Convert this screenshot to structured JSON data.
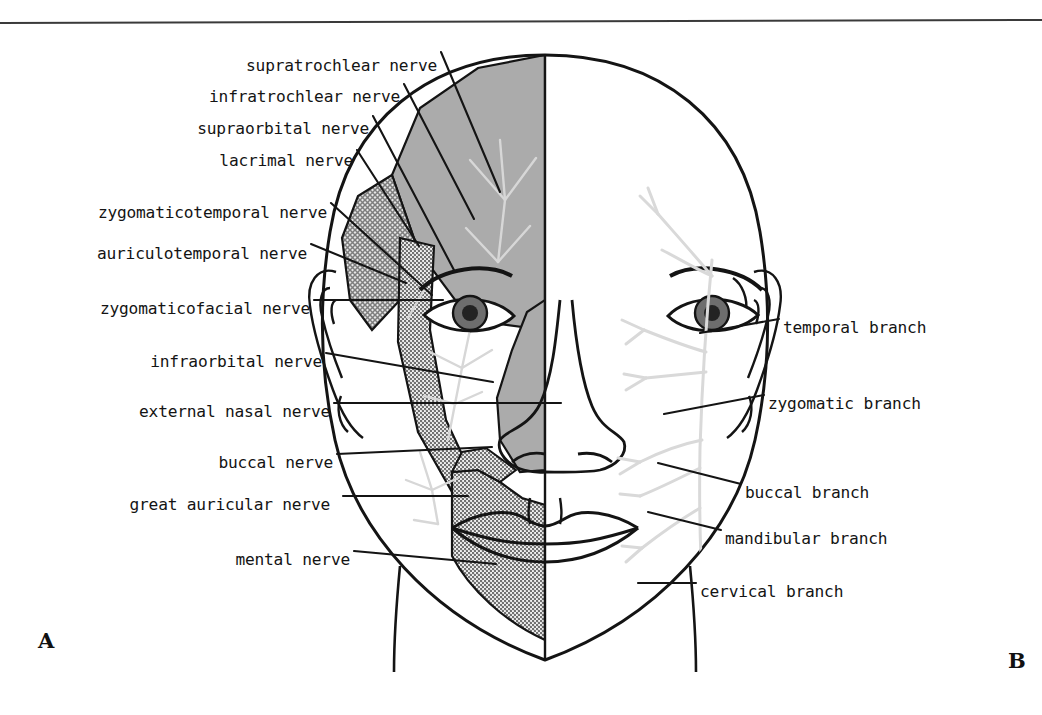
{
  "figure": {
    "panels": [
      {
        "id": "A",
        "letter": "A",
        "side": "left",
        "subject": "sensory cutaneous nerves"
      },
      {
        "id": "B",
        "letter": "B",
        "side": "right",
        "subject": "motor facial nerve branches"
      }
    ],
    "colors": {
      "ink": "#141414",
      "rule": "#3a3a3a",
      "shade_solid": "#a8a8a8",
      "shade_hatch": "#9a9a9a",
      "shade_stipple": "#b4b4b4",
      "nerve_trace": "#d9d9d9",
      "iris": "#6e6e6e",
      "pupil": "#232323",
      "background": "#ffffff"
    }
  },
  "labels_left": [
    {
      "name": "supratrochlear nerve",
      "text": "supratrochlear nerve",
      "x": 437,
      "y": 58,
      "leader": [
        [
          441,
          52
        ],
        [
          500,
          192
        ]
      ]
    },
    {
      "name": "infratrochlear nerve",
      "text": "infratrochlear nerve",
      "x": 400,
      "y": 89,
      "leader": [
        [
          404,
          84
        ],
        [
          474,
          219
        ]
      ]
    },
    {
      "name": "supraorbital nerve",
      "text": "supraorbital nerve",
      "x": 369,
      "y": 121,
      "leader": [
        [
          373,
          116
        ],
        [
          455,
          272
        ]
      ]
    },
    {
      "name": "lacrimal nerve",
      "text": "lacrimal nerve",
      "x": 353,
      "y": 153,
      "leader": [
        [
          357,
          150
        ],
        [
          419,
          246
        ]
      ]
    },
    {
      "name": "zygomaticotemporal nerve",
      "text": "zygomaticotemporal nerve",
      "x": 327,
      "y": 205,
      "leader": [
        [
          331,
          203
        ],
        [
          432,
          295
        ]
      ]
    },
    {
      "name": "auriculotemporal nerve",
      "text": "auriculotemporal nerve",
      "x": 307,
      "y": 246,
      "leader": [
        [
          311,
          244
        ],
        [
          406,
          283
        ]
      ]
    },
    {
      "name": "zygomaticofacial nerve",
      "text": "zygomaticofacial nerve",
      "x": 310,
      "y": 301,
      "leader": [
        [
          314,
          300
        ],
        [
          443,
          300
        ]
      ]
    },
    {
      "name": "infraorbital nerve",
      "text": "infraorbital nerve",
      "x": 322,
      "y": 354,
      "leader": [
        [
          326,
          353
        ],
        [
          493,
          382
        ]
      ]
    },
    {
      "name": "external nasal nerve",
      "text": "external nasal nerve",
      "x": 330,
      "y": 404,
      "leader": [
        [
          334,
          403
        ],
        [
          561,
          403
        ]
      ]
    },
    {
      "name": "buccal nerve",
      "text": "buccal nerve",
      "x": 333,
      "y": 455,
      "leader": [
        [
          337,
          454
        ],
        [
          492,
          447
        ]
      ]
    },
    {
      "name": "great auricular nerve",
      "text": "great auricular nerve",
      "x": 330,
      "y": 497,
      "leader": [
        [
          343,
          496
        ],
        [
          468,
          496
        ]
      ]
    },
    {
      "name": "mental nerve",
      "text": "mental nerve",
      "x": 350,
      "y": 552,
      "leader": [
        [
          354,
          551
        ],
        [
          496,
          564
        ]
      ]
    }
  ],
  "labels_right": [
    {
      "name": "temporal branch",
      "text": "temporal branch",
      "x": 783,
      "y": 320,
      "leader": [
        [
          779,
          319
        ],
        [
          700,
          333
        ]
      ]
    },
    {
      "name": "zygomatic branch",
      "text": "zygomatic branch",
      "x": 768,
      "y": 396,
      "leader": [
        [
          764,
          395
        ],
        [
          664,
          414
        ]
      ]
    },
    {
      "name": "buccal branch",
      "text": "buccal branch",
      "x": 745,
      "y": 485,
      "leader": [
        [
          741,
          484
        ],
        [
          658,
          463
        ]
      ]
    },
    {
      "name": "mandibular branch",
      "text": "mandibular branch",
      "x": 725,
      "y": 531,
      "leader": [
        [
          721,
          530
        ],
        [
          648,
          512
        ]
      ]
    },
    {
      "name": "cervical branch",
      "text": "cervical branch",
      "x": 700,
      "y": 584,
      "leader": [
        [
          696,
          583
        ],
        [
          638,
          583
        ]
      ]
    }
  ]
}
